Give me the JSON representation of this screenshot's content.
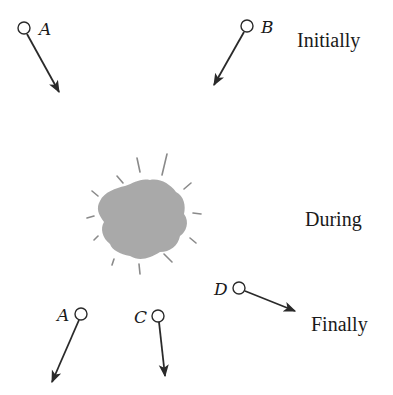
{
  "diagram": {
    "stages": {
      "initially": "Initially",
      "during": "During",
      "finally": "Finally"
    },
    "particles": {
      "initial": [
        {
          "label": "A",
          "circle": [
            24,
            28
          ],
          "arrow_end": [
            59,
            92
          ]
        },
        {
          "label": "B",
          "circle": [
            247,
            26
          ],
          "arrow_end": [
            214,
            85
          ]
        }
      ],
      "final": [
        {
          "label": "A",
          "circle": [
            81,
            314
          ],
          "arrow_end": [
            52,
            382
          ]
        },
        {
          "label": "C",
          "circle": [
            158,
            316
          ],
          "arrow_end": [
            165,
            376
          ]
        },
        {
          "label": "D",
          "circle": [
            239,
            288
          ],
          "arrow_end": [
            295,
            311
          ]
        }
      ]
    },
    "collision": {
      "center": [
        143,
        218
      ],
      "fill_color": "#a9a9a9",
      "ray_color": "#8a8a8a"
    },
    "colors": {
      "ink": "#2a2a2a",
      "background": "#ffffff"
    }
  }
}
